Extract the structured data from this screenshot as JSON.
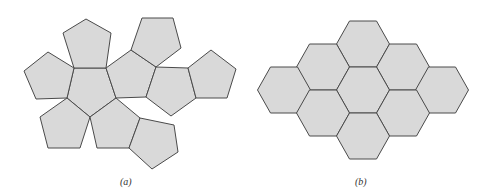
{
  "figure": {
    "panels": [
      {
        "id": "a",
        "caption": "(a)",
        "description": "Net of a dodecahedron: 12 regular pentagons",
        "face_count": 12,
        "faces": [
          "74,68 106,68 116,98 90,117 67,98",
          "74,68 106,68 111,33 86,19 63,33",
          "74,68 67,98 36,99 24,71 48,52",
          "67,98 90,117 80,148 48,148 40,117",
          "90,117 116,98 140,118 129,148 97,148",
          "140,118 129,148 152,169 178,152 174,125",
          "106,68 116,98 146,97 156,67 131,50",
          "131,50 156,67 181,48 173,18 142,18",
          "156,67 146,97 171,116 196,98 188,68",
          "188,68 196,98 227,98 236,69 211,50"
        ]
      },
      {
        "id": "b",
        "caption": "(b)",
        "description": "Patch of 9 regular hexagons",
        "face_count": 9,
        "hex_centers": [
          [
            363,
            44
          ],
          [
            323,
            67
          ],
          [
            403,
            67
          ],
          [
            284,
            90
          ],
          [
            363,
            90
          ],
          [
            442,
            90
          ],
          [
            323,
            113
          ],
          [
            403,
            113
          ],
          [
            363,
            136
          ]
        ],
        "hex_size": {
          "half_width": 26.5,
          "half_height": 23,
          "inner_offset": 13.5
        }
      }
    ],
    "colors": {
      "fill": "#d9d9d9",
      "stroke": "#4a4a4a",
      "background": "#ffffff"
    }
  }
}
